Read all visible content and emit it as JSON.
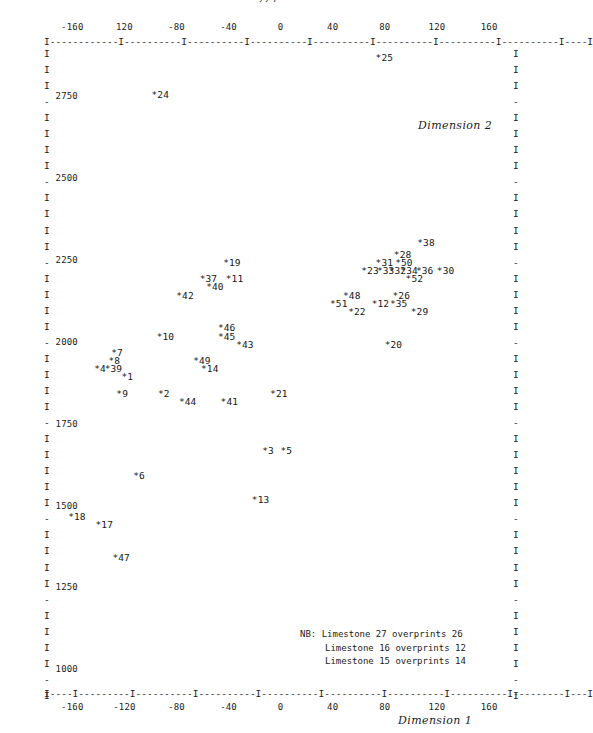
{
  "page": {
    "number": "225"
  },
  "chart_data": {
    "type": "scatter",
    "title": "",
    "xlabel": "Dimension 1",
    "ylabel": "Dimension 2",
    "xlim": [
      -180,
      180
    ],
    "ylim": [
      940,
      2900
    ],
    "grid": false,
    "legend": null,
    "marker": "*",
    "x_ticks_top": [
      "-160",
      "120",
      "-80",
      "-40",
      "0",
      "40",
      "80",
      "120",
      "160"
    ],
    "x_ticks_bottom": [
      "-160",
      "-120",
      "-80",
      "-40",
      "0",
      "40",
      "80",
      "120",
      "160"
    ],
    "y_ticks": [
      "2750",
      "2500",
      "2250",
      "2000",
      "1750",
      "1500",
      "1250",
      "1000"
    ],
    "axis_rule_top": "I------------I----------I----------I----------I----------I----------I----------I----------I----I",
    "axis_rule_bottom": "I----I---------I----------I----------I----------I----------I----------I----------I---------I---I",
    "points": [
      {
        "label": "25",
        "x": 73,
        "y": 2863
      },
      {
        "label": "24",
        "x": -99,
        "y": 2750
      },
      {
        "label": "38",
        "x": 105,
        "y": 2300
      },
      {
        "label": "28",
        "x": 87,
        "y": 2262
      },
      {
        "label": "19",
        "x": -44,
        "y": 2238
      },
      {
        "label": "31",
        "x": 73,
        "y": 2238
      },
      {
        "label": "50",
        "x": 88,
        "y": 2238
      },
      {
        "label": "23",
        "x": 62,
        "y": 2213
      },
      {
        "label": "33",
        "x": 74,
        "y": 2213
      },
      {
        "label": "32",
        "x": 83,
        "y": 2213
      },
      {
        "label": "34",
        "x": 92,
        "y": 2213
      },
      {
        "label": "36",
        "x": 104,
        "y": 2213
      },
      {
        "label": "30",
        "x": 120,
        "y": 2213
      },
      {
        "label": "37",
        "x": -62,
        "y": 2188
      },
      {
        "label": "11",
        "x": -42,
        "y": 2188
      },
      {
        "label": "52",
        "x": 96,
        "y": 2188
      },
      {
        "label": "40",
        "x": -57,
        "y": 2163
      },
      {
        "label": "42",
        "x": -80,
        "y": 2138
      },
      {
        "label": "48",
        "x": 48,
        "y": 2138
      },
      {
        "label": "26",
        "x": 86,
        "y": 2138
      },
      {
        "label": "51",
        "x": 38,
        "y": 2113
      },
      {
        "label": "12",
        "x": 70,
        "y": 2113
      },
      {
        "label": "35",
        "x": 84,
        "y": 2113
      },
      {
        "label": "22",
        "x": 52,
        "y": 2088
      },
      {
        "label": "29",
        "x": 100,
        "y": 2088
      },
      {
        "label": "46",
        "x": -48,
        "y": 2038
      },
      {
        "label": "10",
        "x": -95,
        "y": 2013
      },
      {
        "label": "45",
        "x": -48,
        "y": 2013
      },
      {
        "label": "43",
        "x": -34,
        "y": 1988
      },
      {
        "label": "20",
        "x": 80,
        "y": 1988
      },
      {
        "label": "7",
        "x": -130,
        "y": 1963
      },
      {
        "label": "8",
        "x": -132,
        "y": 1938
      },
      {
        "label": "49",
        "x": -67,
        "y": 1938
      },
      {
        "label": "4",
        "x": -143,
        "y": 1913
      },
      {
        "label": "39",
        "x": -135,
        "y": 1913
      },
      {
        "label": "14",
        "x": -61,
        "y": 1913
      },
      {
        "label": "1",
        "x": -122,
        "y": 1888
      },
      {
        "label": "9",
        "x": -126,
        "y": 1838
      },
      {
        "label": "2",
        "x": -94,
        "y": 1838
      },
      {
        "label": "21",
        "x": -8,
        "y": 1838
      },
      {
        "label": "44",
        "x": -78,
        "y": 1813
      },
      {
        "label": "41",
        "x": -46,
        "y": 1813
      },
      {
        "label": "3",
        "x": -14,
        "y": 1663
      },
      {
        "label": "5",
        "x": 0,
        "y": 1663
      },
      {
        "label": "6",
        "x": -113,
        "y": 1588
      },
      {
        "label": "13",
        "x": -22,
        "y": 1513
      },
      {
        "label": "18",
        "x": -163,
        "y": 1463
      },
      {
        "label": "17",
        "x": -142,
        "y": 1438
      },
      {
        "label": "47",
        "x": -129,
        "y": 1338
      }
    ]
  },
  "footnote": {
    "lines": [
      "NB: Limestone 27 overprints 26",
      "Limestone 16 overprints 12",
      "Limestone 15 overprints 14"
    ]
  },
  "border": {
    "glyph_tick": "-",
    "glyph_fill": "I"
  }
}
